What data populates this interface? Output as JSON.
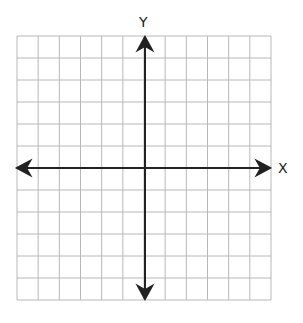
{
  "diagram": {
    "type": "coordinate-plane",
    "x_axis_label": "X",
    "y_axis_label": "Y",
    "grid": {
      "columns": 12,
      "rows": 12,
      "line_color": "#b8b8b8",
      "axis_color": "#222222"
    }
  }
}
